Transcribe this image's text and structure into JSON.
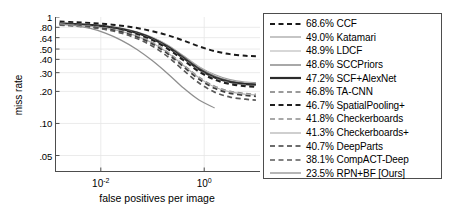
{
  "chart_data": {
    "type": "line",
    "title": "",
    "xlabel": "false positives per image",
    "ylabel": "miss rate",
    "xscale": "log",
    "yscale": "log",
    "xlim": [
      0.0013,
      12.0
    ],
    "ylim": [
      0.035,
      1.0
    ],
    "grid": true,
    "legend_position": "right-outside",
    "xticks": [
      {
        "value": 0.01,
        "label": "10",
        "exponent": "-2"
      },
      {
        "value": 1.0,
        "label": "10",
        "exponent": "0"
      }
    ],
    "yticks": [
      {
        "value": 1.0,
        "label": "1"
      },
      {
        "value": 0.8,
        "label": ".80"
      },
      {
        "value": 0.64,
        "label": ".64"
      },
      {
        "value": 0.5,
        "label": ".50"
      },
      {
        "value": 0.4,
        "label": ".40"
      },
      {
        "value": 0.3,
        "label": ".30"
      },
      {
        "value": 0.2,
        "label": ".20"
      },
      {
        "value": 0.1,
        "label": ".10"
      },
      {
        "value": 0.05,
        "label": ".05"
      }
    ],
    "series": [
      {
        "name": "CCF",
        "score": "68.6%",
        "label": "68.6% CCF",
        "style": "dashed",
        "color": "#1a1a1a",
        "width": 2.0,
        "x": [
          0.0016,
          0.0032,
          0.0063,
          0.0126,
          0.0251,
          0.0501,
          0.1,
          0.2,
          0.398,
          0.794,
          1.585,
          3.162,
          6.31,
          10.0
        ],
        "y": [
          0.905,
          0.893,
          0.878,
          0.858,
          0.828,
          0.788,
          0.735,
          0.672,
          0.6,
          0.53,
          0.478,
          0.448,
          0.432,
          0.428
        ]
      },
      {
        "name": "Katamari",
        "score": "49.0%",
        "label": "49.0% Katamari",
        "style": "solid",
        "color": "#9e9e9e",
        "width": 1.1,
        "x": [
          0.0016,
          0.0032,
          0.0063,
          0.0126,
          0.0251,
          0.0501,
          0.1,
          0.2,
          0.398,
          0.794,
          1.585,
          3.162,
          6.31,
          10.0
        ],
        "y": [
          0.875,
          0.862,
          0.845,
          0.82,
          0.782,
          0.722,
          0.64,
          0.54,
          0.432,
          0.342,
          0.288,
          0.258,
          0.245,
          0.242
        ]
      },
      {
        "name": "LDCF",
        "score": "48.9%",
        "label": "48.9% LDCF",
        "style": "solid",
        "color": "#bdbdbd",
        "width": 1.1,
        "x": [
          0.0016,
          0.0032,
          0.0063,
          0.0126,
          0.0251,
          0.0501,
          0.1,
          0.2,
          0.398,
          0.794,
          1.585,
          3.162,
          6.31,
          10.0
        ],
        "y": [
          0.88,
          0.868,
          0.852,
          0.826,
          0.788,
          0.726,
          0.644,
          0.542,
          0.43,
          0.338,
          0.282,
          0.252,
          0.238,
          0.235
        ]
      },
      {
        "name": "SCCPriors",
        "score": "48.6%",
        "label": "48.6% SCCPriors",
        "style": "solid",
        "color": "#6e6e6e",
        "width": 1.1,
        "x": [
          0.0016,
          0.0032,
          0.0063,
          0.0126,
          0.0251,
          0.0501,
          0.1,
          0.2,
          0.398,
          0.794,
          1.585,
          3.162,
          6.31,
          10.0
        ],
        "y": [
          0.872,
          0.86,
          0.843,
          0.818,
          0.778,
          0.718,
          0.636,
          0.534,
          0.424,
          0.332,
          0.278,
          0.25,
          0.238,
          0.234
        ]
      },
      {
        "name": "SCF+AlexNet",
        "score": "47.2%",
        "label": "47.2% SCF+AlexNet",
        "style": "solid",
        "color": "#2b2b2b",
        "width": 2.2,
        "x": [
          0.0016,
          0.0032,
          0.0063,
          0.0126,
          0.0251,
          0.0501,
          0.1,
          0.2,
          0.398,
          0.794,
          1.585,
          3.162,
          6.31,
          10.0
        ],
        "y": [
          0.87,
          0.858,
          0.84,
          0.814,
          0.772,
          0.71,
          0.625,
          0.52,
          0.41,
          0.322,
          0.27,
          0.245,
          0.234,
          0.231
        ]
      },
      {
        "name": "TA-CNN",
        "score": "46.8%",
        "label": "46.8% TA-CNN",
        "style": "dashed",
        "color": "#7a7a7a",
        "width": 1.6,
        "x": [
          0.0016,
          0.0032,
          0.0063,
          0.0126,
          0.0251,
          0.0501,
          0.1,
          0.2,
          0.398,
          0.794,
          1.585,
          3.162,
          6.31,
          10.0
        ],
        "y": [
          0.866,
          0.852,
          0.834,
          0.806,
          0.764,
          0.7,
          0.616,
          0.512,
          0.402,
          0.315,
          0.265,
          0.24,
          0.229,
          0.226
        ]
      },
      {
        "name": "SpatialPooling+",
        "score": "46.7%",
        "label": "46.7% SpatialPooling+",
        "style": "dashed",
        "color": "#1f1f1f",
        "width": 2.0,
        "x": [
          0.0016,
          0.0032,
          0.0063,
          0.0126,
          0.0251,
          0.0501,
          0.1,
          0.2,
          0.398,
          0.794,
          1.585,
          3.162,
          6.31,
          10.0
        ],
        "y": [
          0.862,
          0.848,
          0.83,
          0.8,
          0.756,
          0.69,
          0.606,
          0.5,
          0.392,
          0.306,
          0.258,
          0.234,
          0.224,
          0.221
        ]
      },
      {
        "name": "Checkerboards",
        "score": "41.8%",
        "label": "41.8% Checkerboards",
        "style": "dashed",
        "color": "#8c8c8c",
        "width": 1.5,
        "x": [
          0.0016,
          0.0032,
          0.0063,
          0.0126,
          0.0251,
          0.0501,
          0.1,
          0.2,
          0.398,
          0.794,
          1.585,
          3.162,
          6.31,
          10.0
        ],
        "y": [
          0.856,
          0.84,
          0.82,
          0.788,
          0.74,
          0.668,
          0.576,
          0.466,
          0.356,
          0.272,
          0.224,
          0.201,
          0.191,
          0.188
        ]
      },
      {
        "name": "Checkerboards+",
        "score": "41.3%",
        "label": "41.3% Checkerboards+",
        "style": "solid",
        "color": "#b0b0b0",
        "width": 1.2,
        "x": [
          0.0016,
          0.0032,
          0.0063,
          0.0126,
          0.0251,
          0.0501,
          0.1,
          0.2,
          0.398,
          0.794,
          1.585,
          3.162,
          6.31,
          10.0
        ],
        "y": [
          0.852,
          0.836,
          0.816,
          0.782,
          0.734,
          0.662,
          0.57,
          0.46,
          0.35,
          0.268,
          0.22,
          0.198,
          0.188,
          0.185
        ]
      },
      {
        "name": "DeepParts",
        "score": "40.7%",
        "label": "40.7% DeepParts",
        "style": "dashed",
        "color": "#3d3d3d",
        "width": 1.7,
        "x": [
          0.0016,
          0.0032,
          0.0063,
          0.0126,
          0.0251,
          0.0501,
          0.1,
          0.2,
          0.398,
          0.794,
          1.585,
          3.162,
          6.31,
          10.0
        ],
        "y": [
          0.846,
          0.83,
          0.808,
          0.774,
          0.724,
          0.65,
          0.558,
          0.448,
          0.34,
          0.26,
          0.214,
          0.192,
          0.183,
          0.18
        ]
      },
      {
        "name": "CompACT-Deep",
        "score": "38.1%",
        "label": "38.1% CompACT-Deep",
        "style": "dashed",
        "color": "#595959",
        "width": 1.7,
        "x": [
          0.0016,
          0.0032,
          0.0063,
          0.0126,
          0.0251,
          0.0501,
          0.1,
          0.2,
          0.398,
          0.794,
          1.585,
          3.162,
          6.31,
          10.0
        ],
        "y": [
          0.84,
          0.822,
          0.798,
          0.76,
          0.706,
          0.628,
          0.532,
          0.422,
          0.316,
          0.24,
          0.197,
          0.177,
          0.169,
          0.166
        ]
      },
      {
        "name": "RPN+BF [Ours]",
        "score": "23.5%",
        "label": "23.5% RPN+BF [Ours]",
        "style": "solid",
        "color": "#8f8f8f",
        "width": 1.3,
        "x": [
          0.0016,
          0.0032,
          0.0063,
          0.0126,
          0.0251,
          0.0501,
          0.1,
          0.2,
          0.398,
          0.794,
          1.585
        ],
        "y": [
          0.862,
          0.83,
          0.78,
          0.702,
          0.604,
          0.496,
          0.388,
          0.292,
          0.215,
          0.166,
          0.14
        ]
      }
    ]
  },
  "axes": {
    "ylabel": "miss rate",
    "xlabel": "false positives per image"
  }
}
